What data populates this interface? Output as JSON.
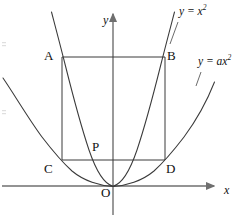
{
  "figure": {
    "type": "geometry-diagram",
    "background_color": "#ffffff",
    "stroke_color": "#3a3a3a",
    "axis_color": "#6f6f6f",
    "text_color": "#111111"
  },
  "axes": {
    "x_label": "x",
    "y_label": "y",
    "origin_label": "O",
    "x_axis": {
      "y_px": 186,
      "x_start_px": 2,
      "x_end_px": 216,
      "arrow": true
    },
    "y_axis": {
      "x_px": 113,
      "y_start_px": 215,
      "y_end_px": 12,
      "arrow": true
    }
  },
  "curves": [
    {
      "name": "steep-parabola",
      "label_plain": "y = x^2",
      "label_lead": "y = x",
      "label_exp": "2",
      "equation_a": 1,
      "label_pos": {
        "x": 180,
        "y": 8
      }
    },
    {
      "name": "wide-parabola",
      "label_plain": "y = ax^2",
      "label_lead": "y = ax",
      "label_exp": "2",
      "equation_a": 0.32,
      "label_pos": {
        "x": 199,
        "y": 58
      }
    }
  ],
  "points": [
    {
      "id": "A",
      "label": "A",
      "x_px": 62,
      "y_px": 57,
      "label_x": 44,
      "label_y": 50
    },
    {
      "id": "B",
      "label": "B",
      "x_px": 165,
      "y_px": 57,
      "label_x": 167,
      "label_y": 50
    },
    {
      "id": "C",
      "label": "C",
      "x_px": 62,
      "y_px": 160,
      "label_x": 44,
      "label_y": 163
    },
    {
      "id": "D",
      "label": "D",
      "x_px": 165,
      "y_px": 160,
      "label_x": 167,
      "label_y": 163
    },
    {
      "id": "P",
      "label": "P",
      "x_px": 100,
      "y_px": 160,
      "label_x": 92,
      "label_y": 140
    },
    {
      "id": "O",
      "label": "O",
      "x_px": 113,
      "y_px": 186,
      "label_x": 101,
      "label_y": 188
    }
  ],
  "rectangle": {
    "name": "ABDC",
    "left_px": 62,
    "right_px": 165,
    "top_px": 57,
    "bottom_px": 160
  }
}
